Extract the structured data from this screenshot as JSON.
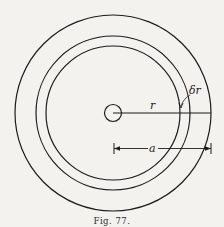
{
  "figure": {
    "caption": "Fig. 77.",
    "labels": {
      "radius": "r",
      "shell_thickness": "δr",
      "outer_radius": "a"
    },
    "colors": {
      "background": "#f4f2ee",
      "ink": "#1c1c1c"
    }
  }
}
